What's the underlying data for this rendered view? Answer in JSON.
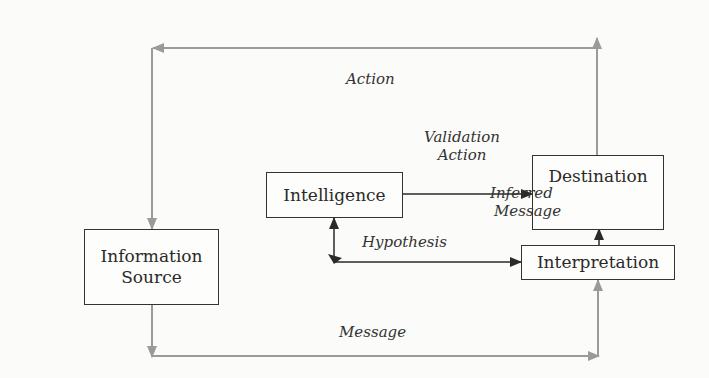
{
  "diagram": {
    "nodes": {
      "information_source": {
        "lines": [
          "Information",
          "Source"
        ]
      },
      "intelligence": {
        "label": "Intelligence"
      },
      "destination": {
        "label": "Destination"
      },
      "interpretation": {
        "label": "Interpretation"
      }
    },
    "edges": {
      "action": {
        "label": "Action",
        "from": "Destination",
        "to": "Information Source",
        "color": "#9a9a9a"
      },
      "validation_action": {
        "lines": [
          "Validation",
          "Action"
        ],
        "from": "Intelligence",
        "to": "Destination",
        "color": "#2a2a2a"
      },
      "inferred_message": {
        "lines": [
          "Inferred",
          "Message"
        ],
        "from": "Interpretation",
        "to": "Destination",
        "color": "#2a2a2a"
      },
      "hypothesis": {
        "label": "Hypothesis",
        "between": [
          "Intelligence",
          "Interpretation"
        ],
        "bidirectional": true,
        "color": "#2a2a2a"
      },
      "message": {
        "label": "Message",
        "from": "Information Source",
        "to": "Interpretation",
        "color": "#9a9a9a"
      }
    }
  }
}
